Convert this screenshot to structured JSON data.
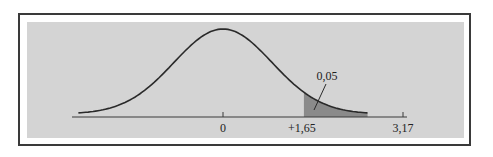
{
  "chart_data": {
    "type": "area",
    "title": "",
    "distribution": {
      "mean": 0,
      "sd": 1
    },
    "x_range": [
      -3.17,
      3.17
    ],
    "curve_x_range": [
      -2.95,
      2.95
    ],
    "shaded_region": {
      "from": 1.65,
      "to": 2.95,
      "label": "0,05"
    },
    "ticks": [
      {
        "value": 0,
        "label": "0"
      },
      {
        "value": 1.65,
        "label": "+1,65"
      },
      {
        "value": 3.17,
        "label": "3,17"
      }
    ],
    "colors": {
      "panel": "#d4d4d4",
      "curve": "#2a2a2a",
      "shade": "#8a8a8a",
      "axis": "#3a3a3a"
    }
  }
}
